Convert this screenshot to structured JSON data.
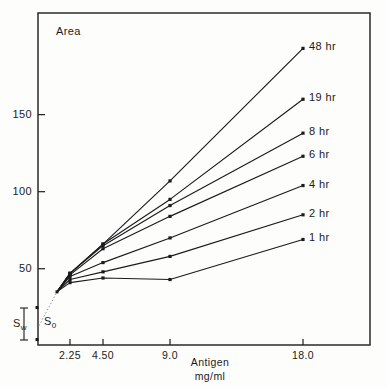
{
  "figure": {
    "y_axis_name": "Area",
    "x_axis_title_line1": "Antigen",
    "x_axis_title_line2": "mg/ml",
    "baseline_markers": [
      {
        "name": "solvent-front-bracket",
        "label_main": "S",
        "label_sub": "w"
      },
      {
        "name": "origin-bracket",
        "label_main": "S",
        "label_sub": "0"
      }
    ],
    "ink_color": "#1b1b1b"
  },
  "chart_data": {
    "type": "line",
    "title": "",
    "xlabel": "Antigen mg/ml",
    "ylabel": "Area",
    "x": [
      2.25,
      4.5,
      9.0,
      18.0
    ],
    "xtick_labels": [
      "2.25",
      "4.50",
      "9.0",
      "18.0"
    ],
    "ytick_labels": [
      "50",
      "100",
      "150"
    ],
    "yticks": [
      50,
      100,
      150
    ],
    "ylim": [
      0,
      200
    ],
    "xscale": "compressed-log",
    "grid": false,
    "legend_position": "inline-right-of-endpoint",
    "marker": "square",
    "common_origin": {
      "x": 1.55,
      "y": 35
    },
    "extrapolation_style": "dotted",
    "series": [
      {
        "name": "48 hr",
        "label": "48 hr",
        "values": [
          47,
          66,
          107,
          193
        ]
      },
      {
        "name": "19 hr",
        "label": "19 hr",
        "values": [
          47,
          66,
          95,
          160
        ]
      },
      {
        "name": "8 hr",
        "label": "8 hr",
        "values": [
          47,
          65,
          91,
          138
        ]
      },
      {
        "name": "6 hr",
        "label": "6 hr",
        "values": [
          46,
          63,
          84,
          123
        ]
      },
      {
        "name": "4 hr",
        "label": "4 hr",
        "values": [
          45,
          54,
          70,
          104
        ]
      },
      {
        "name": "2 hr",
        "label": "2 hr",
        "values": [
          43,
          48,
          58,
          85
        ]
      },
      {
        "name": "1 hr",
        "label": "1 hr",
        "values": [
          41,
          44,
          43,
          69
        ]
      }
    ]
  }
}
